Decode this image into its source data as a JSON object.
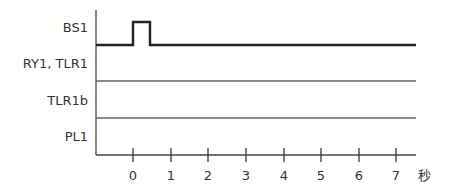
{
  "diagram": {
    "type": "timing-chart",
    "signals": [
      {
        "label": "BS1",
        "waveform": "pulse",
        "pulse_start_s": 0,
        "pulse_end_s": 0.45
      },
      {
        "label": "RY1, TLR1",
        "waveform": "low"
      },
      {
        "label": "TLR1b",
        "waveform": "low"
      },
      {
        "label": "PL1",
        "waveform": "low"
      }
    ],
    "time_axis": {
      "ticks": [
        "0",
        "1",
        "2",
        "3",
        "4",
        "5",
        "6",
        "7"
      ],
      "unit": "秒"
    },
    "colors": {
      "signal_line": "#222222",
      "axis_line": "#444444",
      "row_line": "#555555",
      "text": "#333333"
    }
  }
}
